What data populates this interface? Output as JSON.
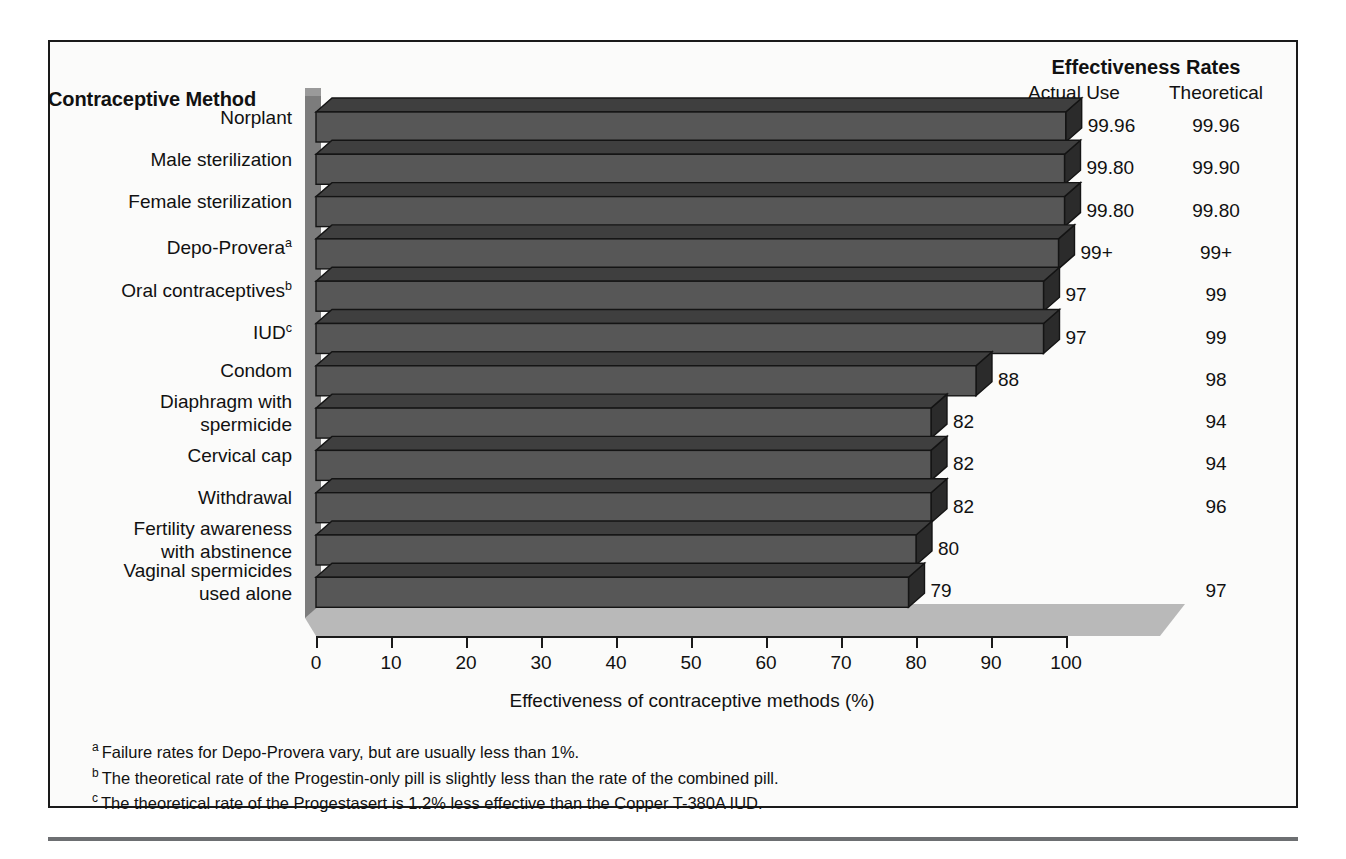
{
  "figure": {
    "method_column_header": "Contraceptive Method",
    "rates_title": "Effectiveness Rates",
    "column_actual": "Actual Use",
    "column_theoretical": "Theoretical"
  },
  "footnotes": [
    {
      "mark": "a",
      "text": "Failure rates for Depo-Provera vary, but are usually less than 1%."
    },
    {
      "mark": "b",
      "text": "The theoretical rate of the Progestin-only pill is slightly less than the rate of the combined pill."
    },
    {
      "mark": "c",
      "text": "The theoretical rate of the Progestasert is 1.2% less effective than the Copper T-380A IUD."
    }
  ],
  "colors": {
    "bar_front": "#575757",
    "bar_top": "#3f3f3f",
    "bar_cap": "#2b2b2b",
    "back_wall": "#7c7c7c",
    "floor": "#b8b8b8",
    "frame": "#1a1a1a",
    "rule": "#6d6f72"
  },
  "chart_data": {
    "type": "bar",
    "orientation": "horizontal",
    "title": "",
    "xlabel": "Effectiveness of contraceptive methods (%)",
    "ylabel": "Contraceptive Method",
    "xlim": [
      0,
      100
    ],
    "xticks": [
      0,
      10,
      20,
      30,
      40,
      50,
      60,
      70,
      80,
      90,
      100
    ],
    "xticklabels": [
      "0",
      "10",
      "20",
      "30",
      "40",
      "50",
      "60",
      "70",
      "80",
      "90",
      "100"
    ],
    "grid": false,
    "legend": null,
    "categories": [
      "Norplant",
      "Male sterilization",
      "Female sterilization",
      "Depo-Provera",
      "Oral contraceptives",
      "IUD",
      "Condom",
      "Diaphragm with spermicide",
      "Cervical cap",
      "Withdrawal",
      "Fertility awareness with abstinence",
      "Vaginal spermicides used alone"
    ],
    "category_lines": [
      [
        "Norplant"
      ],
      [
        "Male sterilization"
      ],
      [
        "Female sterilization"
      ],
      [
        "Depo-Provera"
      ],
      [
        "Oral contraceptives"
      ],
      [
        "IUD"
      ],
      [
        "Condom"
      ],
      [
        "Diaphragm with",
        "spermicide"
      ],
      [
        "Cervical cap"
      ],
      [
        "Withdrawal"
      ],
      [
        "Fertility awareness",
        "with abstinence"
      ],
      [
        "Vaginal spermicides",
        "used alone"
      ]
    ],
    "category_superscripts": [
      "",
      "",
      "",
      "a",
      "b",
      "c",
      "",
      "",
      "",
      "",
      "",
      ""
    ],
    "series": [
      {
        "name": "Actual Use",
        "labels": [
          "99.96",
          "99.80",
          "99.80",
          "99+",
          "97",
          "97",
          "88",
          "82",
          "82",
          "82",
          "80",
          "79"
        ],
        "values": [
          99.96,
          99.8,
          99.8,
          99,
          97,
          97,
          88,
          82,
          82,
          82,
          80,
          79
        ]
      },
      {
        "name": "Theoretical",
        "labels": [
          "99.96",
          "99.90",
          "99.80",
          "99+",
          "99",
          "99",
          "98",
          "94",
          "94",
          "96",
          "",
          "97"
        ],
        "values": [
          99.96,
          99.9,
          99.8,
          99,
          99,
          99,
          98,
          94,
          94,
          96,
          null,
          97
        ]
      }
    ]
  }
}
